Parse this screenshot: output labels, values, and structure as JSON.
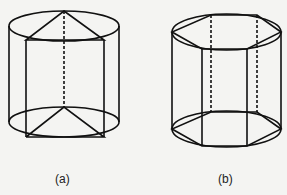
{
  "figures": [
    {
      "id": "a",
      "label": "(a)",
      "description": "Cylinder with inscribed triangular prism"
    },
    {
      "id": "b",
      "label": "(b)",
      "description": "Cylinder with inscribed hexagonal prism"
    }
  ],
  "colors": {
    "stroke": "#111111",
    "background": "#f4f4f2"
  }
}
